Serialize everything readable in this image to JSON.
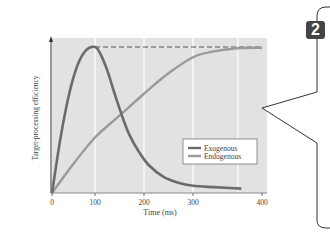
{
  "chart_data": {
    "type": "line",
    "title": "",
    "xlabel": "Time (ms)",
    "ylabel": "Target-processing efficiency",
    "x_ticks": [
      0,
      100,
      200,
      300,
      400
    ],
    "x_tick_px": [
      52,
      95,
      144,
      193,
      262
    ],
    "xlim": [
      0,
      400
    ],
    "ylim": [
      0,
      1.05
    ],
    "grid": true,
    "grid_x": [
      100,
      200,
      300,
      365
    ],
    "legend": {
      "position": "lower-right",
      "entries": [
        "Exogenous",
        "Endogenous"
      ]
    },
    "series": [
      {
        "name": "Exogenous",
        "color": "#6b6b6b",
        "x": [
          0,
          20,
          40,
          60,
          80,
          100,
          110,
          125,
          140,
          155,
          170,
          190,
          210,
          240,
          270,
          300,
          330,
          370
        ],
        "y": [
          0,
          0.38,
          0.68,
          0.88,
          0.98,
          1.0,
          0.96,
          0.84,
          0.68,
          0.53,
          0.4,
          0.28,
          0.19,
          0.11,
          0.07,
          0.05,
          0.04,
          0.03
        ]
      },
      {
        "name": "Endogenous",
        "color": "#9a9a9a",
        "x": [
          0,
          50,
          100,
          150,
          200,
          250,
          300,
          330,
          360,
          400
        ],
        "y": [
          0,
          0.2,
          0.38,
          0.53,
          0.68,
          0.82,
          0.93,
          0.97,
          0.99,
          0.995
        ]
      }
    ],
    "annotations": [
      {
        "type": "dashed-line",
        "from_x": 100,
        "to_x": 400,
        "y": 1.0,
        "label": ""
      }
    ]
  },
  "callout": {
    "badge": "2"
  }
}
